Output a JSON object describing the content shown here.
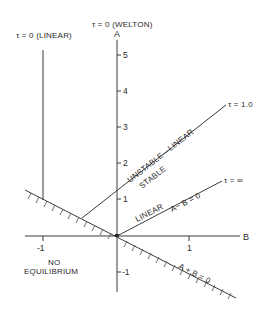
{
  "diagram": {
    "axes": {
      "vertical_label": "A",
      "horizontal_label": "B",
      "a_ticks": [
        "5",
        "4",
        "3",
        "2",
        "1",
        "-1"
      ],
      "b_ticks": [
        "-1",
        "1"
      ]
    },
    "curves": {
      "tau_zero_linear": "τ = 0 (LINEAR)",
      "tau_zero_welton": "τ = 0 (WELTON)",
      "tau_one": "τ = 1.0",
      "tau_infinity": "τ = ∞"
    },
    "region_labels": {
      "unstable_linear": "UNSTABLE—LINEAR",
      "stable": "STABLE",
      "linear": "LINEAR",
      "a_minus_b": "A− B = 0",
      "a_plus_b": "A + B = 0",
      "no": "NO",
      "equilibrium": "EQUILIBRIUM"
    },
    "colors": {
      "ink": "#2a2a2a",
      "background": "#ffffff"
    }
  }
}
